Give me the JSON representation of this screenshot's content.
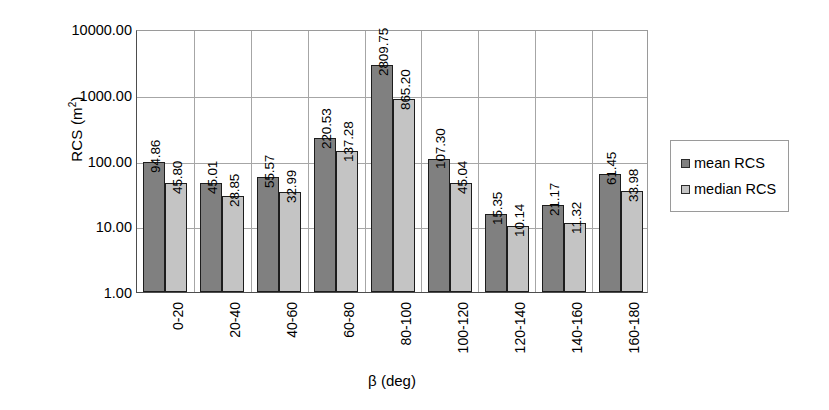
{
  "chart_data": {
    "type": "bar",
    "title": "",
    "xlabel": "β (deg)",
    "ylabel": "RCS (m2)",
    "ylabel_base": "RCS (m",
    "ylabel_sup": "2",
    "ylabel_tail": ")",
    "yscale": "log",
    "ylim": [
      1,
      10000
    ],
    "grid": true,
    "legend_position": "right",
    "ytick_labels": [
      "10000.00",
      "1000.00",
      "100.00",
      "10.00",
      "1.00"
    ],
    "ytick_values": [
      10000,
      1000,
      100,
      10,
      1
    ],
    "categories": [
      "0-20",
      "20-40",
      "40-60",
      "60-80",
      "80-100",
      "100-120",
      "120-140",
      "140-160",
      "160-180"
    ],
    "series": [
      {
        "name": "mean RCS",
        "color": "#808080",
        "values": [
          94.86,
          45.01,
          55.57,
          220.53,
          2809.75,
          107.3,
          15.35,
          21.17,
          61.45
        ],
        "labels": [
          "94.86",
          "45.01",
          "55.57",
          "220.53",
          "2809.75",
          "107.30",
          "15.35",
          "21.17",
          "61.45"
        ]
      },
      {
        "name": "median RCS",
        "color": "#c4c4c4",
        "values": [
          45.8,
          28.85,
          32.99,
          137.28,
          865.2,
          45.04,
          10.14,
          11.32,
          33.98
        ],
        "labels": [
          "45.80",
          "28.85",
          "32.99",
          "137.28",
          "865.20",
          "45.04",
          "10.14",
          "11.32",
          "33.98"
        ]
      }
    ]
  },
  "legend": {
    "items": [
      {
        "label": "mean RCS",
        "color": "#808080"
      },
      {
        "label": "median RCS",
        "color": "#c4c4c4"
      }
    ]
  }
}
